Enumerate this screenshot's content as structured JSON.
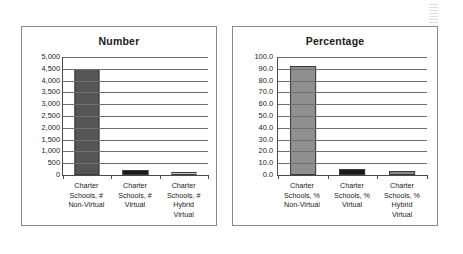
{
  "chart_data": [
    {
      "type": "bar",
      "title": "Number",
      "xlabel": "",
      "ylabel": "",
      "categories": [
        "Charter Schools, # Non-Virtual",
        "Charter Schools, # Virtual",
        "Charter Schools, # Hybrid Virtual"
      ],
      "category_lines": [
        [
          "Charter",
          "Schools, #",
          "Non-Virtual"
        ],
        [
          "Charter",
          "Schools, #",
          "Virtual"
        ],
        [
          "Charter",
          "Schools, #",
          "Hybrid",
          "Virtual"
        ]
      ],
      "values": [
        4500,
        215,
        130
      ],
      "ylim": [
        0,
        5000
      ],
      "ytick_step": 500,
      "ytick_labels": [
        "5,000",
        "4,500",
        "4,000",
        "3,500",
        "3,000",
        "2,500",
        "2,000",
        "1,500",
        "1,000",
        "500",
        "0"
      ],
      "ytick_values": [
        5000,
        4500,
        4000,
        3500,
        3000,
        2500,
        2000,
        1500,
        1000,
        500,
        0
      ],
      "bar_colors": [
        "#555555",
        "#1a1a1a",
        "#c9c9c9"
      ],
      "grid": true,
      "legend": "none"
    },
    {
      "type": "bar",
      "title": "Percentage",
      "xlabel": "",
      "ylabel": "",
      "categories": [
        "Charter Schools, % Non-Virtual",
        "Charter Schools, % Virtual",
        "Charter Schools, % Hybrid Virtual"
      ],
      "category_lines": [
        [
          "Charter",
          "Schools, %",
          "Non-Virtual"
        ],
        [
          "Charter",
          "Schools, %",
          "Virtual"
        ],
        [
          "Charter",
          "Schools, %",
          "Hybrid",
          "Virtual"
        ]
      ],
      "values": [
        92.0,
        5.0,
        3.0
      ],
      "ylim": [
        0,
        100
      ],
      "ytick_step": 10,
      "ytick_labels": [
        "100.0",
        "90.0",
        "80.0",
        "70.0",
        "60.0",
        "50.0",
        "40.0",
        "30.0",
        "20.0",
        "10.0",
        "0.0"
      ],
      "ytick_values": [
        100,
        90,
        80,
        70,
        60,
        50,
        40,
        30,
        20,
        10,
        0
      ],
      "bar_colors": [
        "#8f8f8f",
        "#1a1a1a",
        "#8a8a8a"
      ],
      "grid": true,
      "legend": "none"
    }
  ]
}
